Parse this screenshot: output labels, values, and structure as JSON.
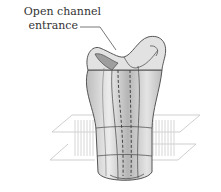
{
  "figure": {
    "label": {
      "line1": "Open channel",
      "line2": "entrance"
    },
    "components": [
      "ion-channel-protein",
      "lipid-bilayer-membrane",
      "central-pore"
    ],
    "colors": {
      "protein_fill": "#d8d8d8",
      "protein_dark": "#a8a8a8",
      "protein_light": "#efefef",
      "outline": "#555555",
      "membrane_line": "#cfcfcf",
      "text": "#333333"
    }
  }
}
